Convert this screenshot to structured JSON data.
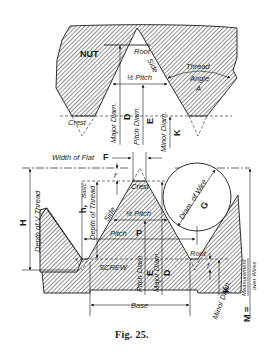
{
  "figure": {
    "caption": "Fig. 25.",
    "nut": {
      "title": "NUT",
      "root": "Root",
      "side": "Side",
      "half_pitch": "½ Pitch",
      "thread_angle_1": "Thread",
      "thread_angle_2": "Angle",
      "thread_angle_letter": "A",
      "crest": "Crest",
      "major_diam": "Major Diam.",
      "major_diam_letter": "D",
      "pitch_diam": "Pitch Diam.",
      "pitch_diam_letter": "E",
      "minor_diam": "Minor Diam.",
      "minor_diam_letter": "K"
    },
    "screw": {
      "title": "SCREW",
      "width_of_flat": "Width of Flat",
      "width_of_flat_letter": "F",
      "f_letter": "f",
      "crest": "Crest",
      "h_letter": "h,",
      "basic": "Basic",
      "depth_of_thread": "Depth of Thread",
      "H_letter": "H",
      "depth_of_v_thread": "Depth of V Thread",
      "side": "Side",
      "half_pitch": "½ Pitch",
      "pitch": "Pitch",
      "pitch_letter": "P",
      "pitch_diam": "Pitch Diam.",
      "pitch_diam_letter": "E",
      "major_diam": "Major Diam.",
      "major_diam_letter": "D",
      "diam_of_wire": "Diam. of Wire",
      "diam_of_wire_letter": "G",
      "root": "Root",
      "f_root_letter": "f",
      "minor_diam": "Minor Diam.",
      "minor_diam_letter": "K",
      "base": "Base",
      "M_letter": "M =",
      "measurement": "Measurement",
      "over_wires": "over Wires"
    }
  }
}
